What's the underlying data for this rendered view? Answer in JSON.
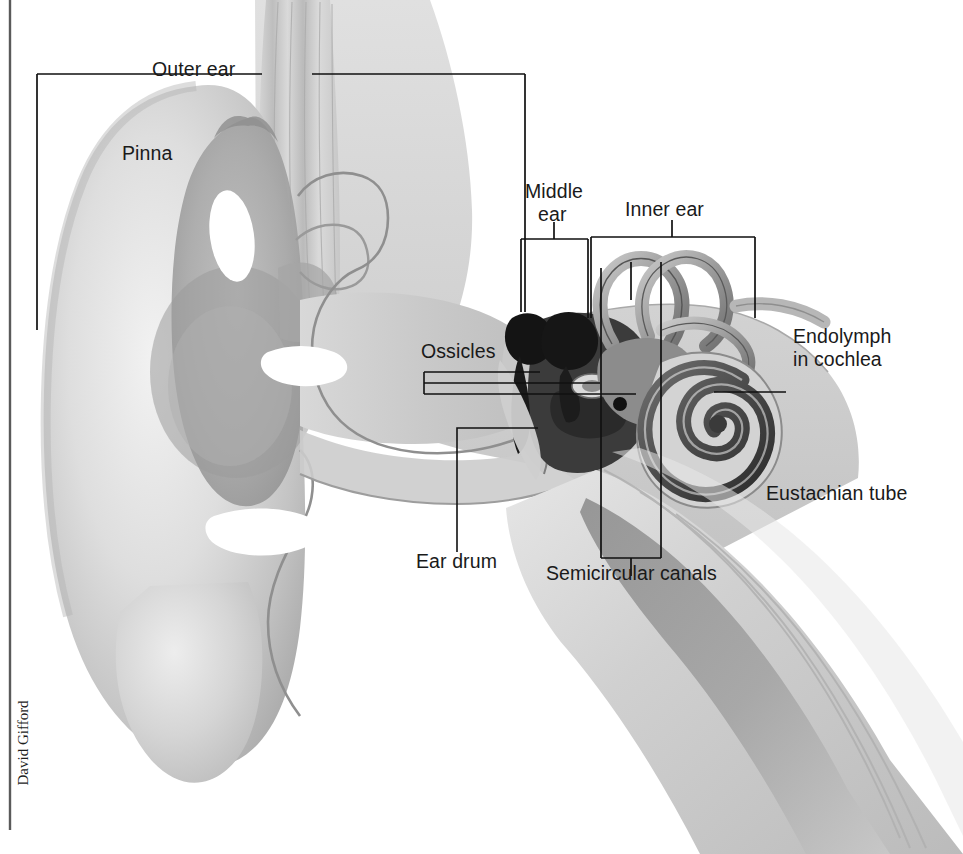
{
  "figure": {
    "style": "grayscale anatomical illustration",
    "credit": "David Gifford",
    "border_color": "#555555",
    "ink_color": "#111111"
  },
  "labels": {
    "outer_ear": "Outer ear",
    "pinna": "Pinna",
    "middle_ear_line1": "Middle",
    "middle_ear_line2": "ear",
    "inner_ear": "Inner ear",
    "ossicles": "Ossicles",
    "endolymph_line1": "Endolymph",
    "endolymph_line2": "in cochlea",
    "eustachian_tube": "Eustachian tube",
    "ear_drum": "Ear drum",
    "semicircular_canals": "Semicircular canals"
  },
  "regions": [
    {
      "name": "outer-ear",
      "label": "Outer ear",
      "bracket": "downward",
      "span_px": [
        37,
        525
      ],
      "baseline_y": 74
    },
    {
      "name": "middle-ear",
      "label": "Middle ear",
      "bracket": "downward",
      "span_px": [
        521,
        588
      ],
      "baseline_y": 239
    },
    {
      "name": "inner-ear",
      "label": "Inner ear",
      "bracket": "downward",
      "span_px": [
        590,
        755
      ],
      "baseline_y": 237
    },
    {
      "name": "semicircular-canals",
      "label": "Semicircular canals",
      "bracket": "upward",
      "span_px": [
        601,
        661
      ],
      "baseline_y": 558
    }
  ],
  "parts": [
    {
      "name": "pinna",
      "label": "Pinna",
      "callout": "none"
    },
    {
      "name": "ossicles",
      "label": "Ossicles",
      "callout": "triple-leader"
    },
    {
      "name": "ear-drum",
      "label": "Ear drum",
      "callout": "elbow-leader"
    },
    {
      "name": "endolymph-in-cochlea",
      "label": "Endolymph in cochlea",
      "callout": "straight-leader"
    },
    {
      "name": "eustachian-tube",
      "label": "Eustachian tube",
      "callout": "none"
    }
  ],
  "palette": {
    "tissue_light": "#dcdcdc",
    "tissue_mid": "#bdbdbd",
    "tissue_dark": "#8f8f8f",
    "cavity_dark": "#3a3a3a",
    "bone_black": "#1c1c1c",
    "highlight": "#ffffff"
  }
}
